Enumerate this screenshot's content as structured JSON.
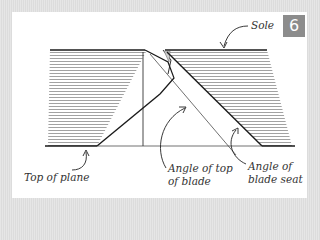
{
  "figure": {
    "number": "6",
    "badge_color": "#8c8c8c"
  },
  "labels": {
    "sole": "Sole",
    "top_of_plane": "Top of plane",
    "angle_top_blade_line1": "Angle of top",
    "angle_top_blade_line2": "of blade",
    "angle_seat_line1": "Angle of",
    "angle_seat_line2": "blade seat"
  },
  "colors": {
    "frame": "#e2e2e2",
    "panel": "#ffffff",
    "ink": "#1a1a1a",
    "hatch": "#777777"
  }
}
